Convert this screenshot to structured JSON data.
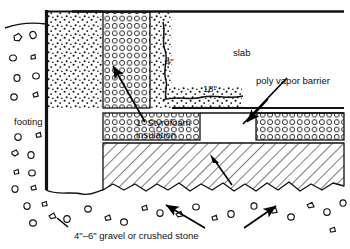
{
  "diagram": {
    "width": 350,
    "height": 249,
    "background_color": "#ffffff",
    "line_color": "#000000"
  },
  "labels": {
    "footing": "footing",
    "slab": "slab",
    "poly_vapor_barrier": "poly vapor barrier",
    "styrofoam_insulation_line1": "1\" Styrofoam",
    "styrofoam_insulation_line2": "insulation",
    "gravel_caption": "4\"–6\" gravel or crushed stone",
    "dim_4in": "4\"",
    "dim_18in": "18\""
  },
  "regions": {
    "soil_fill": "stippled-soil",
    "insulation": "circle-pattern-foam",
    "gravel_base": "diagonal-hatch",
    "native_soil": "scattered-stones"
  }
}
